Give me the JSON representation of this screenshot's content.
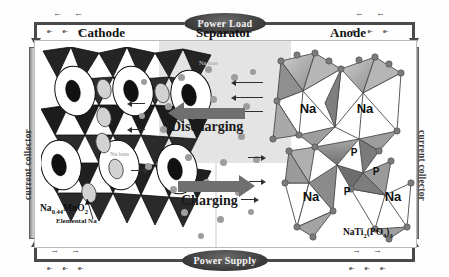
{
  "diagram": {
    "sections": [
      {
        "id": "cathode",
        "label": "Cathode"
      },
      {
        "id": "separator",
        "label": "Separator"
      },
      {
        "id": "anode",
        "label": "Anode"
      }
    ],
    "collectors": {
      "left_label": "current collector",
      "right_label": "current collector"
    },
    "circuit": {
      "top_label": "Power Load",
      "bottom_label": "Power Supply",
      "electron_symbol": "e-",
      "arrow_left": "←",
      "arrow_right": "→"
    },
    "processes": [
      {
        "id": "discharging",
        "label": "Discharging",
        "direction": "left"
      },
      {
        "id": "charging",
        "label": "Charging",
        "direction": "right"
      }
    ],
    "ion_labels": [
      {
        "id": "na-ions-top",
        "text": "Na ions"
      },
      {
        "id": "na-ions-bottom",
        "text": "Na ions"
      }
    ],
    "materials": {
      "cathode_formula_parts": [
        {
          "t": "Na",
          "sub": false
        },
        {
          "t": "0.44",
          "sub": true
        },
        {
          "t": "MnO",
          "sub": false
        },
        {
          "t": "2",
          "sub": true
        }
      ],
      "cathode_caption": "Elemental Na",
      "anode_formula_parts": [
        {
          "t": "NaTi",
          "sub": false
        },
        {
          "t": "2",
          "sub": true
        },
        {
          "t": "(PO",
          "sub": false
        },
        {
          "t": "4",
          "sub": true
        },
        {
          "t": ")",
          "sub": false
        },
        {
          "t": "3",
          "sub": true
        }
      ]
    },
    "anode_sites": [
      {
        "label": "Na",
        "x": 45,
        "y": 70
      },
      {
        "label": "Na",
        "x": 102,
        "y": 70
      },
      {
        "label": "P",
        "x": 91,
        "y": 113
      },
      {
        "label": "P",
        "x": 111,
        "y": 132
      },
      {
        "label": "Na",
        "x": 48,
        "y": 152
      },
      {
        "label": "P",
        "x": 82,
        "y": 148
      },
      {
        "label": "Na",
        "x": 123,
        "y": 152
      }
    ],
    "colors": {
      "wire": "#4a4a4a",
      "collector": "#8d8d8d",
      "separator": "#cdcdcd",
      "process_arrow": "#6f6f6f",
      "ion": "#9d9d9d",
      "cathode_frame": "#2b2b2b",
      "anode_frame": "#9a9a9a",
      "bubble": "#3c3c3c",
      "bubble_text": "#f4f4f4"
    }
  }
}
